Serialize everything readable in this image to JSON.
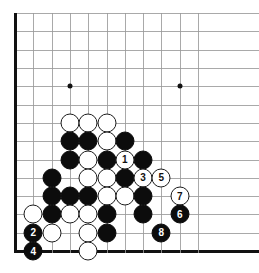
{
  "diagram": {
    "type": "go-board-problem-diagram",
    "board_size": 19,
    "view": "bottom-left-corner-crop",
    "columns_shown": 11,
    "rows_shown": 14,
    "geometry": {
      "left_edge_x": 15,
      "bottom_edge_y": 251,
      "spacing": 18.3,
      "stone_diameter": 19
    },
    "colors": {
      "line": "#9a9a9a",
      "edge_line": "#111111",
      "black_stone": "#0c0c0c",
      "white_stone": "#ffffff",
      "white_stone_border": "#1b1b1b",
      "background": "#ffffff",
      "black_label_text": "#ffffff",
      "white_label_text": "#111111"
    },
    "hoshi": [
      {
        "col": 4,
        "row": 10
      },
      {
        "col": 10,
        "row": 10
      }
    ],
    "stones": [
      {
        "col": 4,
        "row": 8,
        "color": "white",
        "label": ""
      },
      {
        "col": 5,
        "row": 8,
        "color": "white",
        "label": ""
      },
      {
        "col": 6,
        "row": 8,
        "color": "white",
        "label": ""
      },
      {
        "col": 4,
        "row": 7,
        "color": "black",
        "label": ""
      },
      {
        "col": 5,
        "row": 7,
        "color": "black",
        "label": ""
      },
      {
        "col": 6,
        "row": 7,
        "color": "white",
        "label": ""
      },
      {
        "col": 7,
        "row": 7,
        "color": "black",
        "label": ""
      },
      {
        "col": 4,
        "row": 6,
        "color": "black",
        "label": ""
      },
      {
        "col": 5,
        "row": 6,
        "color": "white",
        "label": ""
      },
      {
        "col": 6,
        "row": 6,
        "color": "black",
        "label": ""
      },
      {
        "col": 7,
        "row": 6,
        "color": "white",
        "label": "1"
      },
      {
        "col": 8,
        "row": 6,
        "color": "black",
        "label": ""
      },
      {
        "col": 3,
        "row": 5,
        "color": "black",
        "label": ""
      },
      {
        "col": 5,
        "row": 5,
        "color": "white",
        "label": ""
      },
      {
        "col": 6,
        "row": 5,
        "color": "white",
        "label": ""
      },
      {
        "col": 7,
        "row": 5,
        "color": "black",
        "label": ""
      },
      {
        "col": 8,
        "row": 5,
        "color": "white",
        "label": "3"
      },
      {
        "col": 9,
        "row": 5,
        "color": "white",
        "label": "5"
      },
      {
        "col": 3,
        "row": 4,
        "color": "black",
        "label": ""
      },
      {
        "col": 4,
        "row": 4,
        "color": "black",
        "label": ""
      },
      {
        "col": 5,
        "row": 4,
        "color": "black",
        "label": ""
      },
      {
        "col": 6,
        "row": 4,
        "color": "white",
        "label": ""
      },
      {
        "col": 7,
        "row": 4,
        "color": "white",
        "label": ""
      },
      {
        "col": 8,
        "row": 4,
        "color": "black",
        "label": ""
      },
      {
        "col": 10,
        "row": 4,
        "color": "white",
        "label": "7"
      },
      {
        "col": 2,
        "row": 3,
        "color": "white",
        "label": ""
      },
      {
        "col": 3,
        "row": 3,
        "color": "black",
        "label": ""
      },
      {
        "col": 4,
        "row": 3,
        "color": "white",
        "label": ""
      },
      {
        "col": 5,
        "row": 3,
        "color": "white",
        "label": ""
      },
      {
        "col": 6,
        "row": 3,
        "color": "black",
        "label": ""
      },
      {
        "col": 8,
        "row": 3,
        "color": "black",
        "label": ""
      },
      {
        "col": 10,
        "row": 3,
        "color": "black",
        "label": "6"
      },
      {
        "col": 2,
        "row": 2,
        "color": "black",
        "label": "2"
      },
      {
        "col": 3,
        "row": 2,
        "color": "white",
        "label": ""
      },
      {
        "col": 5,
        "row": 2,
        "color": "white",
        "label": ""
      },
      {
        "col": 6,
        "row": 2,
        "color": "black",
        "label": ""
      },
      {
        "col": 9,
        "row": 2,
        "color": "black",
        "label": "8"
      },
      {
        "col": 2,
        "row": 1,
        "color": "black",
        "label": "4"
      },
      {
        "col": 5,
        "row": 1,
        "color": "white",
        "label": ""
      }
    ],
    "move_sequence": [
      {
        "number": "1",
        "color": "white"
      },
      {
        "number": "2",
        "color": "black"
      },
      {
        "number": "3",
        "color": "white"
      },
      {
        "number": "4",
        "color": "black"
      },
      {
        "number": "5",
        "color": "white"
      },
      {
        "number": "6",
        "color": "black"
      },
      {
        "number": "7",
        "color": "white"
      },
      {
        "number": "8",
        "color": "black"
      }
    ]
  }
}
